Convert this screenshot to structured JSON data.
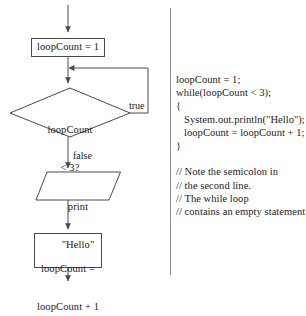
{
  "diagram": {
    "nodes": {
      "start_arrow": "start-arrow",
      "init_box": "loopCount = 1",
      "condition_line1": "loopCount",
      "condition_line2": "< 3?",
      "print_line1": "print",
      "print_line2": "\"Hello\"",
      "increment_line1": "loopCount =",
      "increment_line2": "loopCount + 1"
    },
    "edge_labels": {
      "true": "true",
      "false": "false"
    },
    "colors": {
      "stroke": "#4a4a4a",
      "text": "#1a1a1a",
      "background": "#ffffff",
      "divider": "#8a8a8a"
    }
  },
  "code_panel": {
    "lines": [
      "loopCount = 1;",
      "while(loopCount < 3);",
      "{",
      "   System.out.println(\"Hello\");",
      "   loopCount = loopCount + 1;",
      "}"
    ],
    "comments": [
      "// Note the semicolon in",
      "// the second line.",
      "// The while loop",
      "// contains an empty statement"
    ]
  }
}
